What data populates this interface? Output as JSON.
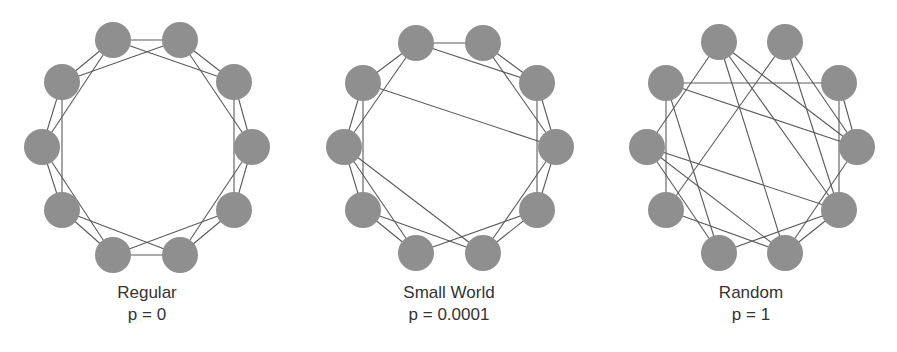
{
  "style": {
    "node_color": "#8f8f8f",
    "edge_color": "#5a5a5a",
    "text_color": "#333333",
    "node_radius": 18
  },
  "node_order": [
    "TL",
    "TR",
    "UR",
    "R",
    "LR",
    "BR",
    "BL",
    "LL",
    "L",
    "UL"
  ],
  "panels": [
    {
      "id": "regular",
      "title": "Regular",
      "param": "p = 0",
      "caption_center_x": 147,
      "nodes": {
        "TL": [
          113,
          40
        ],
        "TR": [
          180,
          40
        ],
        "UR": [
          234,
          82
        ],
        "R": [
          252,
          147
        ],
        "LR": [
          234,
          210
        ],
        "BR": [
          180,
          255
        ],
        "BL": [
          113,
          255
        ],
        "LL": [
          62,
          210
        ],
        "L": [
          42,
          147
        ],
        "UL": [
          62,
          82
        ]
      },
      "edges": [
        [
          "TL",
          "TR"
        ],
        [
          "TR",
          "UR"
        ],
        [
          "UR",
          "R"
        ],
        [
          "R",
          "LR"
        ],
        [
          "LR",
          "BR"
        ],
        [
          "BR",
          "BL"
        ],
        [
          "BL",
          "LL"
        ],
        [
          "LL",
          "L"
        ],
        [
          "L",
          "UL"
        ],
        [
          "UL",
          "TL"
        ],
        [
          "TL",
          "UR"
        ],
        [
          "TR",
          "R"
        ],
        [
          "UR",
          "LR"
        ],
        [
          "R",
          "BR"
        ],
        [
          "LR",
          "BL"
        ],
        [
          "BR",
          "LL"
        ],
        [
          "BL",
          "L"
        ],
        [
          "LL",
          "UL"
        ],
        [
          "L",
          "TL"
        ],
        [
          "UL",
          "TR"
        ]
      ]
    },
    {
      "id": "small-world",
      "title": "Small World",
      "param": "p = 0.0001",
      "caption_center_x": 449,
      "nodes": {
        "TL": [
          416,
          43
        ],
        "TR": [
          483,
          43
        ],
        "UR": [
          537,
          83
        ],
        "R": [
          556,
          147
        ],
        "LR": [
          537,
          210
        ],
        "BR": [
          483,
          253
        ],
        "BL": [
          416,
          253
        ],
        "LL": [
          363,
          210
        ],
        "L": [
          344,
          147
        ],
        "UL": [
          363,
          83
        ]
      },
      "edges": [
        [
          "TL",
          "TR"
        ],
        [
          "TR",
          "UR"
        ],
        [
          "UR",
          "R"
        ],
        [
          "R",
          "LR"
        ],
        [
          "LR",
          "BR"
        ],
        [
          "BL",
          "LL"
        ],
        [
          "LL",
          "L"
        ],
        [
          "L",
          "UL"
        ],
        [
          "UL",
          "TL"
        ],
        [
          "TL",
          "UR"
        ],
        [
          "TR",
          "R"
        ],
        [
          "UR",
          "LR"
        ],
        [
          "R",
          "BR"
        ],
        [
          "LR",
          "BL"
        ],
        [
          "BR",
          "LL"
        ],
        [
          "BL",
          "L"
        ],
        [
          "LL",
          "UL"
        ],
        [
          "L",
          "TL"
        ],
        [
          "UL",
          "R"
        ],
        [
          "L",
          "BR"
        ]
      ]
    },
    {
      "id": "random",
      "title": "Random",
      "param": "p = 1",
      "caption_center_x": 751,
      "nodes": {
        "TL": [
          719,
          42
        ],
        "TR": [
          785,
          42
        ],
        "UR": [
          839,
          83
        ],
        "R": [
          857,
          147
        ],
        "LR": [
          839,
          210
        ],
        "BR": [
          785,
          253
        ],
        "BL": [
          719,
          253
        ],
        "LL": [
          666,
          210
        ],
        "L": [
          647,
          147
        ],
        "UL": [
          666,
          83
        ]
      },
      "edges": [
        [
          "UL",
          "UR"
        ],
        [
          "UL",
          "R"
        ],
        [
          "UL",
          "LL"
        ],
        [
          "UL",
          "BL"
        ],
        [
          "TL",
          "L"
        ],
        [
          "TL",
          "BR"
        ],
        [
          "TL",
          "R"
        ],
        [
          "TL",
          "LR"
        ],
        [
          "TR",
          "LL"
        ],
        [
          "TR",
          "LR"
        ],
        [
          "TR",
          "R"
        ],
        [
          "UR",
          "R"
        ],
        [
          "UR",
          "LR"
        ],
        [
          "R",
          "BR"
        ],
        [
          "L",
          "LR"
        ],
        [
          "L",
          "BL"
        ],
        [
          "L",
          "BR"
        ],
        [
          "LL",
          "BR"
        ],
        [
          "BL",
          "LR"
        ],
        [
          "BR",
          "LR"
        ]
      ]
    }
  ]
}
